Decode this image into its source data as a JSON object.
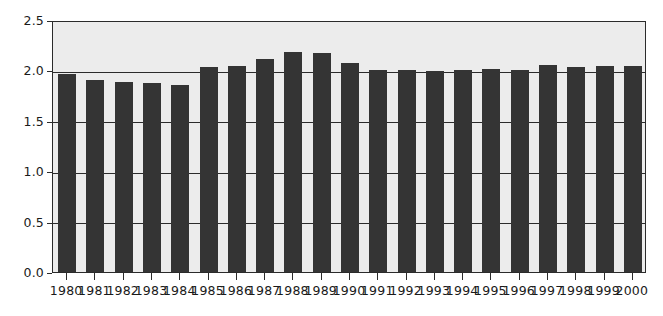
{
  "chart_data": {
    "type": "bar",
    "title": "",
    "subtitle": "",
    "xlabel": "",
    "ylabel": "",
    "categories": [
      "1980",
      "1981",
      "1982",
      "1983",
      "1984",
      "1985",
      "1986",
      "1987",
      "1988",
      "1989",
      "1990",
      "1991",
      "1992",
      "1993",
      "1994",
      "1995",
      "1996",
      "1997",
      "1998",
      "1999",
      "2000"
    ],
    "values": [
      1.96,
      1.9,
      1.89,
      1.88,
      1.86,
      2.03,
      2.04,
      2.11,
      2.18,
      2.17,
      2.07,
      2.0,
      2.0,
      1.99,
      2.0,
      2.01,
      2.0,
      2.05,
      2.03,
      2.04,
      2.04
    ],
    "series": [
      {
        "name": "",
        "values": [
          1.96,
          1.9,
          1.89,
          1.88,
          1.86,
          2.03,
          2.04,
          2.11,
          2.18,
          2.17,
          2.07,
          2.0,
          2.0,
          1.99,
          2.0,
          2.01,
          2.0,
          2.05,
          2.03,
          2.04,
          2.04
        ]
      }
    ],
    "ylim": [
      0.0,
      2.5
    ],
    "yticks": [
      0.0,
      0.5,
      1.0,
      1.5,
      2.0,
      2.5
    ],
    "ytick_labels": [
      "0.0",
      "0.5",
      "1.0",
      "1.5",
      "2.0",
      "2.5"
    ],
    "xtick_labels": [
      "1980",
      "1981",
      "1982",
      "1983",
      "1984",
      "1985",
      "1986",
      "1987",
      "1988",
      "1989",
      "1990",
      "1991",
      "1992",
      "1993",
      "1994",
      "1995",
      "1996",
      "1997",
      "1998",
      "1999",
      "2000"
    ],
    "grid": true,
    "grid_axis": "y",
    "legend": null,
    "legend_position": "none",
    "annotations": [],
    "colors": {
      "bar": "#343434",
      "plot_background": "#ececec",
      "page_background": "#ffffff",
      "axis": "#2b2b2b",
      "gridline": "#2b2b2b",
      "tick_label": "#1a1a1a"
    }
  }
}
